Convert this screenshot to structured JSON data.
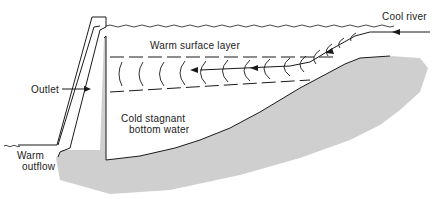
{
  "diagram": {
    "labels": {
      "cool_river": "Cool river",
      "warm_surface_layer": "Warm surface layer",
      "outlet": "Outlet",
      "cold_water_line1": "Cold stagnant",
      "cold_water_line2": "bottom water",
      "warm_outflow_line1": "Warm",
      "warm_outflow_line2": "outflow"
    },
    "colors": {
      "ground": "#cfcfcf",
      "line": "#1a1a1a",
      "background": "#ffffff"
    }
  }
}
